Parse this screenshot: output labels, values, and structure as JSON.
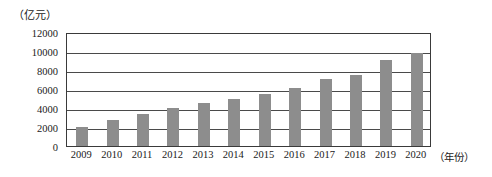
{
  "chart_data": {
    "type": "bar",
    "title": "",
    "subtitle": "",
    "unit_label": "（亿元）",
    "xlabel": "（年份）",
    "ylabel": "",
    "categories": [
      "2009",
      "2010",
      "2011",
      "2012",
      "2013",
      "2014",
      "2015",
      "2016",
      "2017",
      "2018",
      "2019",
      "2020"
    ],
    "values": [
      2000,
      2700,
      3400,
      4000,
      4500,
      5000,
      5500,
      6100,
      7100,
      7500,
      9100,
      9800
    ],
    "ylim": [
      0,
      12000
    ],
    "ytick_labels": [
      "12000",
      "10000",
      "8000",
      "6000",
      "4000",
      "2000",
      "0"
    ],
    "ytick_values": [
      12000,
      10000,
      8000,
      6000,
      4000,
      2000,
      0
    ],
    "grid": true,
    "legend": false,
    "legend_position": "none",
    "bar_color": "#8d8d8d",
    "axis_color": "#3a3a3a",
    "background_color": "#ffffff"
  }
}
